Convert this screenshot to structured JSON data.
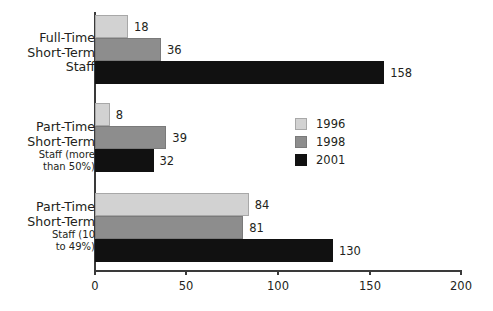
{
  "chart_data": {
    "type": "bar",
    "orientation": "horizontal",
    "title": "",
    "subtitle": "",
    "xlabel": "",
    "ylabel": "",
    "xlim": [
      0,
      200
    ],
    "xticks": [
      0,
      50,
      100,
      150,
      200
    ],
    "xtick_labels": [
      "0",
      "50",
      "100",
      "150",
      "200"
    ],
    "grid": false,
    "legend_position": "center-right",
    "categories": [
      "Full-Time Short-Term Staff",
      "Part-Time Short-Term Staff (more than 50%)",
      "Part-Time Short-Term Staff (10 to 49%)"
    ],
    "series": [
      {
        "name": "1996",
        "color": "#d2d2d2",
        "values": [
          18,
          8,
          84
        ]
      },
      {
        "name": "1998",
        "color": "#8d8d8d",
        "values": [
          36,
          39,
          81
        ]
      },
      {
        "name": "2001",
        "color": "#111111",
        "values": [
          158,
          32,
          130
        ]
      }
    ]
  },
  "categories_display": [
    {
      "lines": [
        "Full-Time",
        "Short-Term",
        "Staff"
      ],
      "small_from": 3
    },
    {
      "lines": [
        "Part-Time",
        "Short-Term",
        "Staff (more",
        "than 50%)"
      ],
      "small_from": 2
    },
    {
      "lines": [
        "Part-Time",
        "Short-Term",
        "Staff (10",
        "to 49%)"
      ],
      "small_from": 2
    }
  ],
  "legend": {
    "items": [
      {
        "label": "1996",
        "swatch": "light-gray-swatch"
      },
      {
        "label": "1998",
        "swatch": "medium-gray-swatch"
      },
      {
        "label": "2001",
        "swatch": "black-swatch"
      }
    ]
  },
  "axis": {
    "tick_labels": [
      "0",
      "50",
      "100",
      "150",
      "200"
    ]
  },
  "bar_value_labels": {
    "g0": [
      "18",
      "36",
      "158"
    ],
    "g1": [
      "8",
      "39",
      "32"
    ],
    "g2": [
      "84",
      "81",
      "130"
    ]
  }
}
